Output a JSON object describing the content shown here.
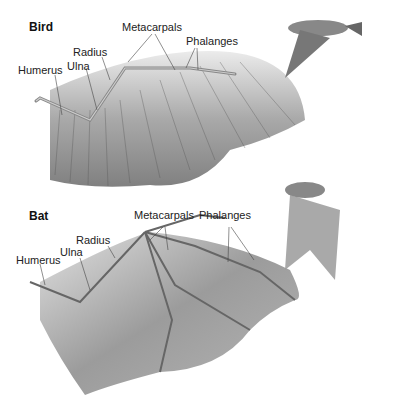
{
  "panels": [
    {
      "title": "Bird",
      "labels": {
        "metacarpals": "Metacarpals",
        "phalanges": "Phalanges",
        "radius": "Radius",
        "ulna": "Ulna",
        "humerus": "Humerus"
      },
      "inset": "flying-bird"
    },
    {
      "title": "Bat",
      "labels": {
        "metacarpals": "Metacarpals",
        "phalanges": "Phalanges",
        "radius": "Radius",
        "ulna": "Ulna",
        "humerus": "Humerus"
      },
      "inset": "flying-bat"
    }
  ],
  "colors": {
    "background": "#ffffff",
    "wing_dark": "#6e6e6e",
    "wing_light": "#c8c8c8",
    "bone": "#9a9a9a",
    "leader_line": "#444444"
  }
}
